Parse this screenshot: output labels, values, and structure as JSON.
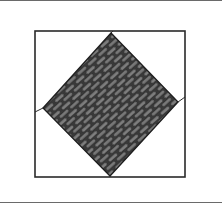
{
  "figure": {
    "colors": {
      "background": "#ffffff",
      "outline": "#2a2a2a",
      "texture_fill": "#7e7e7e",
      "texture_stroke": "#1e1e1e",
      "rule": "#6a6a6a"
    },
    "outer_square": {
      "x": 35,
      "y": 31,
      "width": 150,
      "height": 146
    },
    "diamond": {
      "points": [
        [
          111,
          33
        ],
        [
          178,
          102
        ],
        [
          110,
          176
        ],
        [
          43,
          108
        ]
      ]
    },
    "connectors": [
      [
        [
          111,
          33
        ],
        [
          113,
          31
        ]
      ],
      [
        [
          178,
          102
        ],
        [
          185,
          97
        ]
      ],
      [
        [
          110,
          176
        ],
        [
          110,
          177
        ]
      ],
      [
        [
          43,
          108
        ],
        [
          35,
          112
        ]
      ]
    ]
  }
}
